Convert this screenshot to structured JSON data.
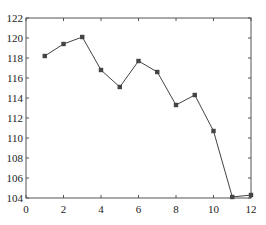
{
  "chart_data": {
    "type": "line",
    "title": "",
    "xlabel": "",
    "ylabel": "",
    "xlim": [
      0,
      12
    ],
    "ylim": [
      104,
      122
    ],
    "xticks": [
      0,
      2,
      4,
      6,
      8,
      10,
      12
    ],
    "yticks": [
      104,
      106,
      108,
      110,
      112,
      114,
      116,
      118,
      120,
      122
    ],
    "grid": false,
    "legend": null,
    "series": [
      {
        "name": "series-1",
        "marker": "square",
        "color": "#444444",
        "x": [
          1,
          2,
          3,
          4,
          5,
          6,
          7,
          8,
          9,
          10,
          11,
          12
        ],
        "y": [
          118.2,
          119.4,
          120.1,
          116.8,
          115.1,
          117.7,
          116.6,
          113.3,
          114.3,
          110.7,
          104.1,
          104.3
        ]
      }
    ]
  },
  "style": {
    "axis_color": "#555555",
    "line_color": "#444444",
    "marker_color": "#444444"
  }
}
